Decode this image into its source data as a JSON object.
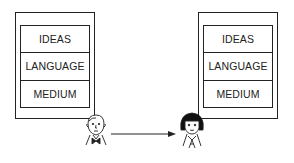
{
  "diagram": {
    "sender": {
      "role": "sender",
      "layers": [
        "IDEAS",
        "LANGUAGE",
        "MEDIUM"
      ]
    },
    "receiver": {
      "role": "receiver",
      "layers": [
        "IDEAS",
        "LANGUAGE",
        "MEDIUM"
      ]
    },
    "arrow": {
      "direction": "sender-to-receiver"
    },
    "colors": {
      "line": "#222222",
      "background": "#ffffff"
    }
  }
}
